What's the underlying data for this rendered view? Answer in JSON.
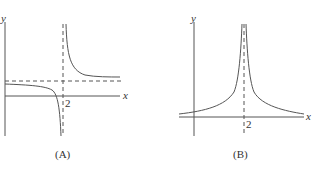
{
  "panels": [
    {
      "caption": "(A)",
      "x_axis_label": "x",
      "y_axis_label": "y",
      "tick_label": "2",
      "description": "Hyperbola-like curve with vertical asymptote at x = 2 and horizontal asymptote above the x-axis"
    },
    {
      "caption": "(B)",
      "x_axis_label": "x",
      "y_axis_label": "y",
      "tick_label": "2",
      "description": "Curve with vertical asymptote at x = 2, positive on both sides, approaching the x-axis"
    }
  ]
}
